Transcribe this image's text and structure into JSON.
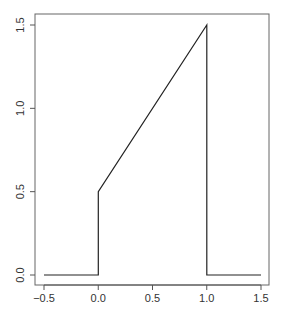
{
  "chart_data": {
    "type": "line",
    "title": "",
    "xlabel": "",
    "ylabel": "",
    "xlim": [
      -0.5,
      1.5
    ],
    "ylim": [
      0.0,
      1.5
    ],
    "grid": false,
    "legend": null,
    "x_ticks": [
      "-0.5",
      "0.0",
      "0.5",
      "1.0",
      "1.5"
    ],
    "y_ticks": [
      "0.0",
      "0.5",
      "1.0",
      "1.5"
    ],
    "series": [
      {
        "name": "f(x)",
        "color": "#000000",
        "points": [
          {
            "x": -0.5,
            "y": 0.0
          },
          {
            "x": 0.0,
            "y": 0.0
          },
          {
            "x": 0.0,
            "y": 0.5
          },
          {
            "x": 1.0,
            "y": 1.5
          },
          {
            "x": 1.0,
            "y": 0.0
          },
          {
            "x": 1.5,
            "y": 0.0
          }
        ]
      }
    ]
  },
  "colors": {
    "axis": "#555555",
    "line": "#222222",
    "text": "#333333"
  }
}
